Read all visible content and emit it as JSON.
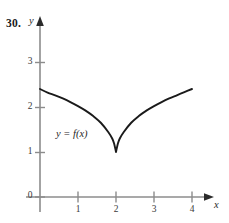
{
  "page": {
    "clipped_header_text": "",
    "problem_number": "30."
  },
  "figure": {
    "axis_labels": {
      "x": "x",
      "y": "y"
    },
    "curve_label": "y = f(x)"
  },
  "chart_data": {
    "type": "line",
    "title": "",
    "xlabel": "x",
    "ylabel": "y",
    "xlim": [
      0,
      4.4
    ],
    "ylim": [
      0,
      3.6
    ],
    "grid": false,
    "legend": null,
    "annotations": [
      {
        "text": "y = f(x)",
        "x": 0.55,
        "y": 1.45
      }
    ],
    "xticks": [
      1,
      2,
      3,
      4
    ],
    "xtick_labels": [
      "1",
      "2",
      "3",
      "4"
    ],
    "yticks": [
      0,
      1,
      2,
      3
    ],
    "ytick_labels": [
      "0",
      "1",
      "2",
      "3"
    ],
    "series": [
      {
        "name": "f(x)",
        "color": "#1a1a1a",
        "description": "Curve with a sharp cusp (corner) at x = 2 where f(2) = 1; decreasing and concave down on [0,2], increasing and concave down on [2,4]; endpoints near y = 2.4.",
        "x": [
          0,
          0.2,
          0.4,
          0.6,
          0.8,
          1.0,
          1.2,
          1.4,
          1.6,
          1.8,
          1.9,
          1.95,
          2.0,
          2.05,
          2.1,
          2.2,
          2.4,
          2.6,
          2.8,
          3.0,
          3.2,
          3.4,
          3.6,
          3.8,
          4.0
        ],
        "y": [
          2.4,
          2.32,
          2.26,
          2.19,
          2.11,
          2.02,
          1.92,
          1.8,
          1.65,
          1.44,
          1.3,
          1.19,
          1.0,
          1.19,
          1.3,
          1.44,
          1.65,
          1.8,
          1.92,
          2.02,
          2.11,
          2.19,
          2.26,
          2.33,
          2.4
        ]
      }
    ],
    "cusp_point": {
      "x": 2,
      "y": 1
    }
  },
  "colors": {
    "curve": "#1a1a1a",
    "axis": "#8c8c8c",
    "tick": "#8c8c8c",
    "text": "#1a1a1a",
    "background": "#ffffff"
  }
}
